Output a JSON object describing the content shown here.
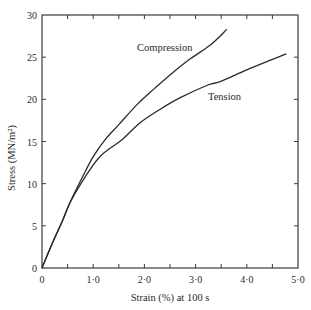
{
  "chart_data": {
    "type": "line",
    "title": "",
    "xlabel": "Strain (%) at 100 s",
    "ylabel": "Stress (MN/m²)",
    "xlim": [
      0,
      5.0
    ],
    "ylim": [
      0,
      30
    ],
    "grid": false,
    "legend_position": "inline labels on curves",
    "x_ticks": [
      0,
      1.0,
      2.0,
      3.0,
      4.0,
      5.0
    ],
    "x_tick_labels": [
      "0",
      "1·0",
      "2·0",
      "3·0",
      "4·0",
      "5·0"
    ],
    "x_minor_ticks": [
      0.5,
      1.5,
      2.5,
      3.5,
      4.5
    ],
    "y_ticks": [
      0,
      5,
      10,
      15,
      20,
      25,
      30
    ],
    "y_tick_labels": [
      "0",
      "5",
      "10",
      "15",
      "20",
      "25",
      "30"
    ],
    "series": [
      {
        "name": "Compression",
        "x": [
          0,
          0.2,
          0.4,
          0.55,
          0.8,
          1.0,
          1.23,
          1.5,
          1.86,
          2.2,
          2.5,
          2.87,
          3.28,
          3.61
        ],
        "y": [
          0,
          2.9,
          5.6,
          7.8,
          10.9,
          13.2,
          15.2,
          17.0,
          19.4,
          21.3,
          22.9,
          24.7,
          26.4,
          28.3
        ]
      },
      {
        "name": "Tension",
        "x": [
          0,
          0.2,
          0.4,
          0.55,
          0.8,
          1.13,
          1.56,
          1.91,
          2.3,
          2.7,
          3.24,
          3.48,
          4.0,
          4.4,
          4.77
        ],
        "y": [
          0,
          2.9,
          5.6,
          7.8,
          10.4,
          13.2,
          15.2,
          17.2,
          18.8,
          20.2,
          21.7,
          22.1,
          23.5,
          24.5,
          25.4
        ]
      }
    ],
    "annotations": [
      {
        "text": "Compression",
        "x": 1.85,
        "y": 26.0
      },
      {
        "text": "Tension",
        "x": 3.25,
        "y": 20.5
      }
    ]
  },
  "labels": {
    "xlabel": "Strain (%) at 100 s",
    "ylabel": "Stress (MN/m²)",
    "compression": "Compression",
    "tension": "Tension"
  },
  "style": {
    "line_color": "#2a2a2a",
    "axis_color": "#3a3a3a",
    "background": "#ffffff"
  }
}
